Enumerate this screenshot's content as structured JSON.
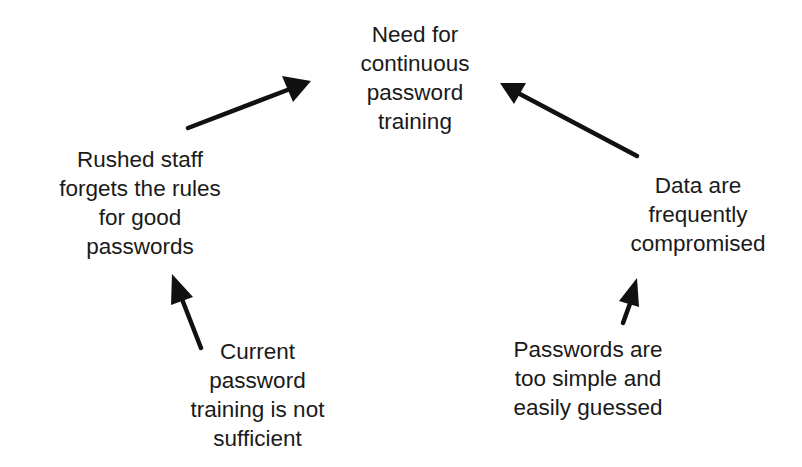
{
  "diagram": {
    "type": "cause-effect cycle",
    "nodes": [
      {
        "id": "need",
        "lines": [
          "Need for",
          "continuous",
          "password",
          "training"
        ]
      },
      {
        "id": "rushed",
        "lines": [
          "Rushed staff",
          "forgets the rules",
          "for good",
          "passwords"
        ]
      },
      {
        "id": "current",
        "lines": [
          "Current",
          "password",
          "training is not",
          "sufficient"
        ]
      },
      {
        "id": "data",
        "lines": [
          "Data are",
          "frequently",
          "compromised"
        ]
      },
      {
        "id": "simple",
        "lines": [
          "Passwords are",
          "too simple and",
          "easily guessed"
        ]
      }
    ],
    "edges": [
      {
        "from": "current",
        "to": "rushed"
      },
      {
        "from": "rushed",
        "to": "need"
      },
      {
        "from": "simple",
        "to": "data"
      },
      {
        "from": "data",
        "to": "need"
      }
    ],
    "colors": {
      "text": "#1a1a1a",
      "arrow": "#111111",
      "background": "#ffffff"
    }
  }
}
